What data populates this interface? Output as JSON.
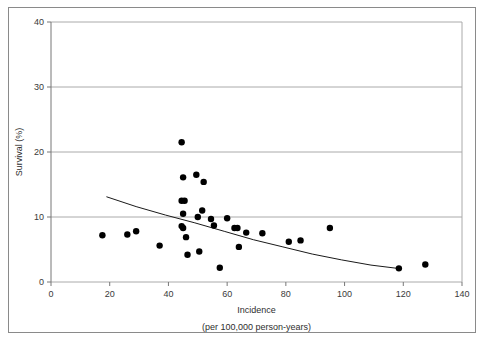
{
  "figure": {
    "has_outer_border": true,
    "border_color": "#8a8a8a",
    "background": "#ffffff"
  },
  "chart_data": {
    "type": "scatter",
    "title": "",
    "subtitle": "",
    "xlabel": "Incidence",
    "xlabel_sub": "(per 100,000 person-years)",
    "ylabel": "Survival (%)",
    "xlim": [
      0,
      140
    ],
    "ylim": [
      0,
      40
    ],
    "xticks": [
      0,
      20,
      40,
      60,
      80,
      100,
      120,
      140
    ],
    "yticks": [
      0,
      10,
      20,
      30,
      40
    ],
    "xtick_labels": [
      "0",
      "20",
      "40",
      "60",
      "80",
      "100",
      "120",
      "140"
    ],
    "ytick_labels": [
      "0",
      "10",
      "20",
      "30",
      "40"
    ],
    "grid": "horizontal",
    "grid_color": "#aaaaaa",
    "legend": "none",
    "marker_color": "#000000",
    "marker_size": 3.2,
    "points": [
      {
        "x": 17.5,
        "y": 7.2
      },
      {
        "x": 26.0,
        "y": 7.3
      },
      {
        "x": 29.0,
        "y": 7.8
      },
      {
        "x": 37.0,
        "y": 5.6
      },
      {
        "x": 44.5,
        "y": 21.5
      },
      {
        "x": 45.0,
        "y": 16.1
      },
      {
        "x": 44.5,
        "y": 12.5
      },
      {
        "x": 45.5,
        "y": 12.5
      },
      {
        "x": 45.0,
        "y": 10.5
      },
      {
        "x": 44.5,
        "y": 8.6
      },
      {
        "x": 45.0,
        "y": 8.3
      },
      {
        "x": 46.0,
        "y": 6.9
      },
      {
        "x": 46.5,
        "y": 4.2
      },
      {
        "x": 49.5,
        "y": 16.5
      },
      {
        "x": 50.0,
        "y": 10.0
      },
      {
        "x": 52.0,
        "y": 15.4
      },
      {
        "x": 51.5,
        "y": 11.0
      },
      {
        "x": 50.5,
        "y": 4.7
      },
      {
        "x": 54.5,
        "y": 9.7
      },
      {
        "x": 55.5,
        "y": 8.7
      },
      {
        "x": 57.5,
        "y": 2.2
      },
      {
        "x": 60.0,
        "y": 9.8
      },
      {
        "x": 62.5,
        "y": 8.3
      },
      {
        "x": 63.5,
        "y": 8.3
      },
      {
        "x": 64.0,
        "y": 5.4
      },
      {
        "x": 66.5,
        "y": 7.6
      },
      {
        "x": 72.0,
        "y": 7.5
      },
      {
        "x": 81.0,
        "y": 6.2
      },
      {
        "x": 85.0,
        "y": 6.4
      },
      {
        "x": 95.0,
        "y": 8.3
      },
      {
        "x": 118.5,
        "y": 2.1
      },
      {
        "x": 127.5,
        "y": 2.7
      }
    ],
    "fit_curve": {
      "type": "exponential-decay",
      "color": "#1a1a1a",
      "x_start": 19.0,
      "x_end": 118.0,
      "points": [
        {
          "x": 19.0,
          "y": 13.1
        },
        {
          "x": 29.0,
          "y": 11.6
        },
        {
          "x": 39.0,
          "y": 10.3
        },
        {
          "x": 49.0,
          "y": 9.1
        },
        {
          "x": 59.0,
          "y": 7.8
        },
        {
          "x": 69.0,
          "y": 6.5
        },
        {
          "x": 79.0,
          "y": 5.4
        },
        {
          "x": 89.0,
          "y": 4.3
        },
        {
          "x": 99.0,
          "y": 3.4
        },
        {
          "x": 109.0,
          "y": 2.6
        },
        {
          "x": 118.0,
          "y": 2.1
        }
      ]
    }
  }
}
